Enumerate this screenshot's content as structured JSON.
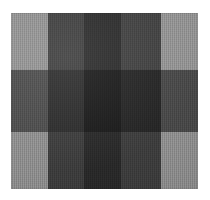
{
  "image": {
    "subject": "gingham plaid fabric swatch",
    "description": "Close-up photograph of a grey gingham / buffalo-check cloth showing five vertical stripe bands crossed by three horizontal stripe bands.",
    "canvas": {
      "width": 210,
      "height": 200,
      "background": "#ffffff"
    },
    "swatch": {
      "left": 11,
      "top": 13,
      "width": 187,
      "height": 176
    }
  },
  "pattern": {
    "type": "gingham-check",
    "columns": 5,
    "rows": 3,
    "column_widths": [
      37,
      36,
      37,
      40,
      37
    ],
    "row_heights": [
      57,
      62,
      57
    ],
    "column_tones": [
      "light",
      "dark",
      "darkest",
      "dark",
      "light"
    ],
    "row_tones": [
      "light",
      "dark",
      "light"
    ],
    "palette": {
      "light_gray": "#8e8e8e",
      "mid_gray": "#7f7f7f",
      "dark_gray": "#3d3d3d",
      "darker_gray": "#2f2f2f",
      "deep_gray": "#2a2a2a",
      "shadow_gray": "#4a4a4a",
      "near_black": "#1a1a1a",
      "black": "#141414"
    },
    "grid": [
      {
        "row": 1,
        "cells": [
          {
            "col": 1,
            "color": "#8e8e8e",
            "tone": "light"
          },
          {
            "col": 2,
            "color": "#3d3d3d",
            "tone": "dark"
          },
          {
            "col": 3,
            "color": "#2a2a2a",
            "tone": "darkest"
          },
          {
            "col": 4,
            "color": "#3f3f3f",
            "tone": "dark"
          },
          {
            "col": 5,
            "color": "#909090",
            "tone": "light"
          }
        ]
      },
      {
        "row": 2,
        "cells": [
          {
            "col": 1,
            "color": "#4a4a4a",
            "tone": "dark"
          },
          {
            "col": 2,
            "color": "#2b2b2b",
            "tone": "darker"
          },
          {
            "col": 3,
            "color": "#1a1a1a",
            "tone": "near-black"
          },
          {
            "col": 4,
            "color": "#242424",
            "tone": "darker"
          },
          {
            "col": 5,
            "color": "#474747",
            "tone": "dark"
          }
        ]
      },
      {
        "row": 3,
        "cells": [
          {
            "col": 1,
            "color": "#8b8b8b",
            "tone": "light"
          },
          {
            "col": 2,
            "color": "#3b3b3b",
            "tone": "dark"
          },
          {
            "col": 3,
            "color": "#282828",
            "tone": "darkest"
          },
          {
            "col": 4,
            "color": "#3c3c3c",
            "tone": "dark"
          },
          {
            "col": 5,
            "color": "#8d8d8d",
            "tone": "light"
          }
        ]
      }
    ]
  }
}
